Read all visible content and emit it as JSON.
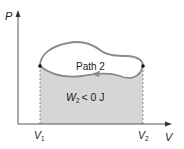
{
  "diagram": {
    "y_axis_label": "P",
    "x_axis_label": "V",
    "path_label": "Path 2",
    "work_label_main": "W",
    "work_label_sub": "2",
    "work_label_rest": "< 0  J",
    "v1_main": "V",
    "v1_sub": "1",
    "v2_main": "V",
    "v2_sub": "2",
    "colors": {
      "axis": "#555555",
      "curve": "#8a8a8a",
      "shade": "#d6d6d6",
      "dot": "#111111",
      "text": "#222222"
    }
  }
}
